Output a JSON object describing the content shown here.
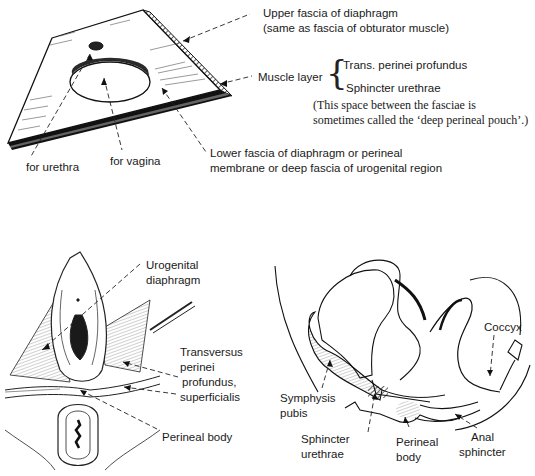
{
  "figure": {
    "panels": [
      {
        "id": "top",
        "subject": "urogenital diaphragm block diagram",
        "labels": {
          "upper_fascia_line1": "Upper fascia of diaphragm",
          "upper_fascia_line2": "(same as fascia of obturator muscle)",
          "muscle_layer": "Muscle layer",
          "muscle_1": "Trans. perinei profundus",
          "muscle_2": "Sphincter urethrae",
          "note_line1": "(This space between the fasciae is",
          "note_line2": "sometimes called the ‘deep perineal pouch’.)",
          "lower_fascia_line1": "Lower fascia of diaphragm or perineal",
          "lower_fascia_line2": "membrane or deep fascia of urogenital region",
          "for_urethra": "for urethra",
          "for_vagina": "for vagina"
        }
      },
      {
        "id": "bottom-left",
        "subject": "perineum dissection view",
        "labels": {
          "urogenital_line1": "Urogenital",
          "urogenital_line2": "diaphragm",
          "transversus_line1": "Transversus",
          "transversus_line2": "perinei",
          "transversus_line3": "profundus,",
          "transversus_line4": "superficialis",
          "perineal_body": "Perineal body"
        }
      },
      {
        "id": "bottom-right",
        "subject": "sagittal section of female pelvis",
        "labels": {
          "coccyx": "Coccyx",
          "symphysis_line1": "Symphysis",
          "symphysis_line2": "pubis",
          "sphincter_urethrae_line1": "Sphincter",
          "sphincter_urethrae_line2": "urethrae",
          "perineal_body_line1": "Perineal",
          "perineal_body_line2": "body",
          "anal_sphincter_line1": "Anal",
          "anal_sphincter_line2": "sphincter"
        }
      }
    ]
  }
}
